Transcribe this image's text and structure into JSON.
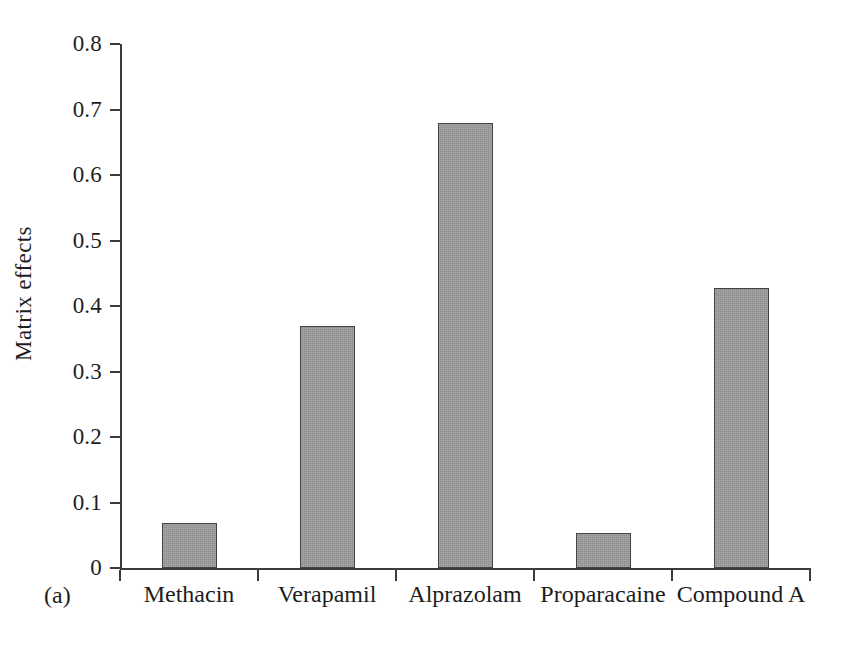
{
  "figure": {
    "panel_label": "(a)",
    "background_color": "#ffffff",
    "bar_fill_color": "#8c8c8c",
    "bar_edge_color": "#434343",
    "axis_color": "#3b3b3b"
  },
  "chart_data": {
    "type": "bar",
    "title": "",
    "subtitle": "",
    "xlabel": "",
    "ylabel": "Matrix effects",
    "categories": [
      "Methacin",
      "Verapamil",
      "Alprazolam",
      "Proparacaine",
      "Compound A"
    ],
    "values": [
      0.068,
      0.369,
      0.679,
      0.053,
      0.427
    ],
    "series": [
      {
        "name": "Matrix effects",
        "values": [
          0.068,
          0.369,
          0.679,
          0.053,
          0.427
        ]
      }
    ],
    "ylim": [
      0,
      0.8
    ],
    "ytick_labels": [
      "0.8",
      "0.7",
      "0.6",
      "0.5",
      "0.4",
      "0.3",
      "0.2",
      "0.1",
      "0"
    ],
    "ytick_values": [
      0.8,
      0.7,
      0.6,
      0.5,
      0.4,
      0.3,
      0.2,
      0.1,
      0
    ],
    "grid": false,
    "legend": false,
    "legend_position": "none",
    "annotations": [
      "(a)"
    ],
    "orientation": "vertical"
  }
}
